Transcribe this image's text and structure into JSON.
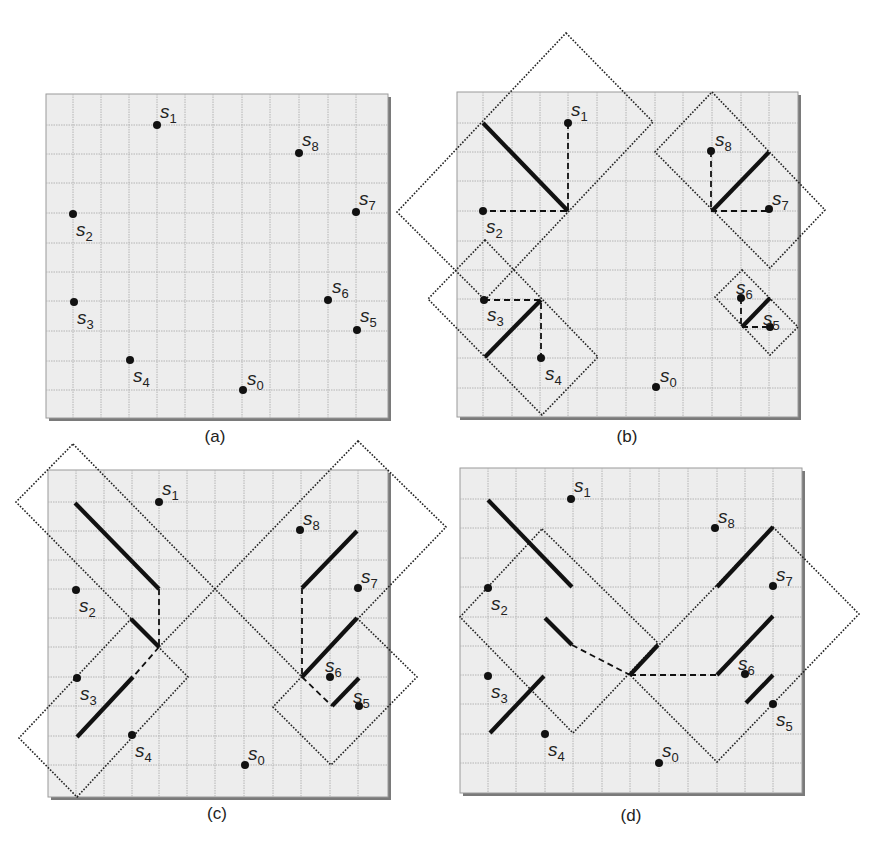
{
  "figure": {
    "width": 885,
    "height": 846,
    "colors": {
      "panel_fill": "#ededed",
      "grid": "#b4b4b4",
      "ink": "#111111",
      "shadow": "#7a7a7a"
    },
    "panels": [
      {
        "id": "a",
        "caption": "(a)",
        "caption_pos": [
          215,
          442
        ],
        "box": {
          "x": 46,
          "y": 94,
          "w": 342,
          "h": 324
        },
        "grid_x": [
          73,
          101,
          129,
          157,
          185,
          213,
          242,
          270,
          299,
          328,
          356
        ],
        "grid_y": [
          125,
          154,
          183,
          213,
          243,
          272,
          301,
          331,
          361,
          390
        ],
        "points": [
          {
            "name": "s",
            "sub": "0",
            "x": 243,
            "y": 390,
            "lx": 247,
            "ly": 385
          },
          {
            "name": "s",
            "sub": "1",
            "x": 157,
            "y": 125,
            "lx": 160,
            "ly": 118
          },
          {
            "name": "s",
            "sub": "2",
            "x": 73,
            "y": 214,
            "lx": 76,
            "ly": 236
          },
          {
            "name": "s",
            "sub": "3",
            "x": 74,
            "y": 302,
            "lx": 77,
            "ly": 324
          },
          {
            "name": "s",
            "sub": "4",
            "x": 130,
            "y": 360,
            "lx": 133,
            "ly": 382
          },
          {
            "name": "s",
            "sub": "5",
            "x": 357,
            "y": 330,
            "lx": 360,
            "ly": 322
          },
          {
            "name": "s",
            "sub": "6",
            "x": 328,
            "y": 300,
            "lx": 332,
            "ly": 293
          },
          {
            "name": "s",
            "sub": "7",
            "x": 356,
            "y": 212,
            "lx": 359,
            "ly": 205
          },
          {
            "name": "s",
            "sub": "8",
            "x": 299,
            "y": 153,
            "lx": 302,
            "ly": 146
          }
        ],
        "regions": [],
        "thick_segments": [],
        "dashed_paths": []
      },
      {
        "id": "b",
        "caption": "(b)",
        "caption_pos": [
          627,
          442
        ],
        "box": {
          "x": 457,
          "y": 92,
          "w": 341,
          "h": 325
        },
        "grid_x": [
          483,
          512,
          540,
          568,
          597,
          626,
          655,
          683,
          712,
          741,
          769
        ],
        "grid_y": [
          123,
          152,
          181,
          211,
          241,
          270,
          299,
          329,
          358,
          388
        ],
        "points": [
          {
            "name": "s",
            "sub": "0",
            "x": 656,
            "y": 387,
            "lx": 660,
            "ly": 382
          },
          {
            "name": "s",
            "sub": "1",
            "x": 568,
            "y": 123,
            "lx": 571,
            "ly": 116
          },
          {
            "name": "s",
            "sub": "2",
            "x": 483,
            "y": 211,
            "lx": 486,
            "ly": 233
          },
          {
            "name": "s",
            "sub": "3",
            "x": 484,
            "y": 300,
            "lx": 487,
            "ly": 321
          },
          {
            "name": "s",
            "sub": "4",
            "x": 541,
            "y": 358,
            "lx": 545,
            "ly": 380
          },
          {
            "name": "s",
            "sub": "5",
            "x": 770,
            "y": 327,
            "lx": 763,
            "ly": 325
          },
          {
            "name": "s",
            "sub": "6",
            "x": 741,
            "y": 298,
            "lx": 736,
            "ly": 294
          },
          {
            "name": "s",
            "sub": "7",
            "x": 769,
            "y": 209,
            "lx": 772,
            "ly": 205
          },
          {
            "name": "s",
            "sub": "8",
            "x": 711,
            "y": 151,
            "lx": 715,
            "ly": 146
          }
        ],
        "regions": [
          {
            "id": "r-s1-s2",
            "points": [
              [
                566,
                33
              ],
              [
                653,
                122
              ],
              [
                485,
                300
              ],
              [
                397,
                212
              ]
            ]
          },
          {
            "id": "r-s7-s8",
            "points": [
              [
                712,
                92
              ],
              [
                825,
                210
              ],
              [
                770,
                268
              ],
              [
                655,
                152
              ]
            ]
          },
          {
            "id": "r-s3-s4",
            "points": [
              [
                485,
                240
              ],
              [
                598,
                357
              ],
              [
                542,
                415
              ],
              [
                428,
                299
              ]
            ]
          },
          {
            "id": "r-s5-s6",
            "points": [
              [
                742,
                270
              ],
              [
                798,
                327
              ],
              [
                770,
                355
              ],
              [
                715,
                297
              ]
            ]
          }
        ],
        "thick_segments": [
          [
            [
              483,
              123
            ],
            [
              568,
              211
            ]
          ],
          [
            [
              712,
              211
            ],
            [
              769,
              152
            ]
          ],
          [
            [
              485,
              357
            ],
            [
              541,
              300
            ]
          ],
          [
            [
              742,
              327
            ],
            [
              770,
              298
            ]
          ]
        ],
        "dashed_paths": [
          [
            [
              568,
              123
            ],
            [
              568,
              211
            ],
            [
              483,
              211
            ]
          ],
          [
            [
              711,
              151
            ],
            [
              711,
              211
            ],
            [
              769,
              211
            ]
          ],
          [
            [
              484,
              300
            ],
            [
              541,
              300
            ],
            [
              541,
              358
            ]
          ],
          [
            [
              741,
              298
            ],
            [
              741,
              327
            ],
            [
              770,
              327
            ]
          ]
        ]
      },
      {
        "id": "c",
        "caption": "(c)",
        "caption_pos": [
          217,
          819
        ],
        "box": {
          "x": 48,
          "y": 470,
          "w": 340,
          "h": 327
        },
        "grid_x": [
          76,
          104,
          132,
          159,
          187,
          215,
          244,
          273,
          301,
          330,
          358
        ],
        "grid_y": [
          502,
          531,
          560,
          589,
          618,
          647,
          677,
          706,
          736,
          765
        ],
        "points": [
          {
            "name": "s",
            "sub": "0",
            "x": 245,
            "y": 765,
            "lx": 248,
            "ly": 760
          },
          {
            "name": "s",
            "sub": "1",
            "x": 159,
            "y": 502,
            "lx": 162,
            "ly": 495
          },
          {
            "name": "s",
            "sub": "2",
            "x": 76,
            "y": 590,
            "lx": 79,
            "ly": 612
          },
          {
            "name": "s",
            "sub": "3",
            "x": 77,
            "y": 678,
            "lx": 80,
            "ly": 700
          },
          {
            "name": "s",
            "sub": "4",
            "x": 132,
            "y": 735,
            "lx": 135,
            "ly": 757
          },
          {
            "name": "s",
            "sub": "5",
            "x": 359,
            "y": 706,
            "lx": 353,
            "ly": 703
          },
          {
            "name": "s",
            "sub": "6",
            "x": 330,
            "y": 677,
            "lx": 325,
            "ly": 672
          },
          {
            "name": "s",
            "sub": "7",
            "x": 358,
            "y": 588,
            "lx": 361,
            "ly": 583
          },
          {
            "name": "s",
            "sub": "8",
            "x": 300,
            "y": 530,
            "lx": 303,
            "ly": 525
          }
        ],
        "regions": [
          {
            "id": "r-upper-left",
            "points": [
              [
                73,
                444
              ],
              [
                215,
                589
              ],
              [
                159,
                647
              ],
              [
                16,
                502
              ]
            ]
          },
          {
            "id": "r-lower-left",
            "points": [
              [
                131,
                619
              ],
              [
                188,
                677
              ],
              [
                77,
                797
              ],
              [
                19,
                738
              ]
            ]
          },
          {
            "id": "r-upper-right",
            "points": [
              [
                358,
                441
              ],
              [
                446,
                527
              ],
              [
                302,
                677
              ],
              [
                215,
                589
              ]
            ]
          },
          {
            "id": "r-lower-right",
            "points": [
              [
                357,
                618
              ],
              [
                417,
                677
              ],
              [
                331,
                765
              ],
              [
                273,
                707
              ]
            ]
          }
        ],
        "thick_segments": [
          [
            [
              75,
              503
            ],
            [
              159,
              589
            ]
          ],
          [
            [
              131,
              619
            ],
            [
              159,
              647
            ]
          ],
          [
            [
              77,
              737
            ],
            [
              133,
              677
            ]
          ],
          [
            [
              302,
              588
            ],
            [
              357,
              531
            ]
          ],
          [
            [
              302,
              677
            ],
            [
              357,
              618
            ]
          ],
          [
            [
              332,
              706
            ],
            [
              359,
              678
            ]
          ]
        ],
        "dashed_paths": [
          [
            [
              159,
              589
            ],
            [
              159,
              647
            ]
          ],
          [
            [
              159,
              647
            ],
            [
              133,
              677
            ]
          ],
          [
            [
              302,
              588
            ],
            [
              302,
              677
            ]
          ],
          [
            [
              302,
              677
            ],
            [
              332,
              706
            ]
          ]
        ]
      },
      {
        "id": "d",
        "caption": "(d)",
        "caption_pos": [
          631,
          821
        ],
        "box": {
          "x": 460,
          "y": 468,
          "w": 342,
          "h": 325
        },
        "grid_x": [
          488,
          516,
          545,
          573,
          602,
          630,
          659,
          688,
          717,
          745,
          773
        ],
        "grid_y": [
          499,
          528,
          558,
          587,
          617,
          646,
          675,
          704,
          734,
          763
        ],
        "points": [
          {
            "name": "s",
            "sub": "0",
            "x": 659,
            "y": 763,
            "lx": 662,
            "ly": 757
          },
          {
            "name": "s",
            "sub": "1",
            "x": 571,
            "y": 499,
            "lx": 574,
            "ly": 492
          },
          {
            "name": "s",
            "sub": "2",
            "x": 488,
            "y": 588,
            "lx": 491,
            "ly": 610
          },
          {
            "name": "s",
            "sub": "3",
            "x": 488,
            "y": 676,
            "lx": 491,
            "ly": 698
          },
          {
            "name": "s",
            "sub": "4",
            "x": 545,
            "y": 734,
            "lx": 548,
            "ly": 756
          },
          {
            "name": "s",
            "sub": "5",
            "x": 773,
            "y": 704,
            "lx": 776,
            "ly": 726
          },
          {
            "name": "s",
            "sub": "6",
            "x": 745,
            "y": 674,
            "lx": 738,
            "ly": 670
          },
          {
            "name": "s",
            "sub": "7",
            "x": 773,
            "y": 586,
            "lx": 776,
            "ly": 581
          },
          {
            "name": "s",
            "sub": "8",
            "x": 715,
            "y": 528,
            "lx": 718,
            "ly": 523
          }
        ],
        "regions": [
          {
            "id": "r-left",
            "points": [
              [
                542,
                529
              ],
              [
                658,
                643
              ],
              [
                573,
                733
              ],
              [
                460,
                617
              ]
            ]
          },
          {
            "id": "r-right",
            "points": [
              [
                773,
                527
              ],
              [
                859,
                614
              ],
              [
                717,
                762
              ],
              [
                630,
                675
              ]
            ]
          }
        ],
        "thick_segments": [
          [
            [
              488,
              500
            ],
            [
              572,
              587
            ]
          ],
          [
            [
              545,
              618
            ],
            [
              572,
              645
            ]
          ],
          [
            [
              490,
              733
            ],
            [
              544,
              676
            ]
          ],
          [
            [
              630,
              675
            ],
            [
              658,
              645
            ]
          ],
          [
            [
              717,
              587
            ],
            [
              773,
              527
            ]
          ],
          [
            [
              717,
              675
            ],
            [
              773,
              616
            ]
          ],
          [
            [
              746,
              703
            ],
            [
              773,
              675
            ]
          ]
        ],
        "dashed_paths": [
          [
            [
              572,
              645
            ],
            [
              630,
              675
            ]
          ],
          [
            [
              630,
              675
            ],
            [
              717,
              675
            ]
          ]
        ]
      }
    ]
  }
}
